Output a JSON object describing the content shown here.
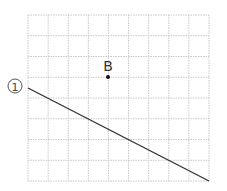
{
  "diagram": {
    "grid": {
      "x0": 28,
      "y0": 15,
      "x1": 209,
      "y1": 181,
      "cols": 9,
      "rows": 8,
      "color": "#c8c8c8"
    },
    "point": {
      "label": "B",
      "x": 108,
      "y": 77
    },
    "line": {
      "label": "①",
      "x1": 28,
      "y1": 88,
      "x2": 209,
      "y2": 181,
      "color": "#333333"
    }
  }
}
